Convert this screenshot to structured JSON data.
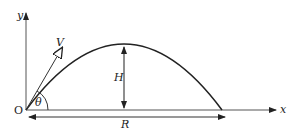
{
  "diagram": {
    "type": "projectile-motion",
    "labels": {
      "origin": "O",
      "x_axis": "x",
      "y_axis": "y",
      "velocity": "V",
      "angle": "θ",
      "max_height": "H",
      "range": "R"
    },
    "colors": {
      "stroke": "#222222",
      "background": "#ffffff"
    }
  }
}
